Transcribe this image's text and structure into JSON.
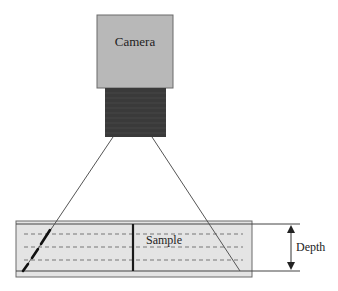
{
  "diagram": {
    "camera": {
      "label": "Camera",
      "body_color": "#b8b8b8",
      "lens_color": "#3a3a3a"
    },
    "sample": {
      "label": "Sample",
      "fill_color": "#e4e4e4",
      "dashed_layers": 3
    },
    "depth": {
      "label": "Depth"
    },
    "colors": {
      "stroke": "#333333",
      "beam": "#555555",
      "focus_segment": "#111111"
    }
  }
}
